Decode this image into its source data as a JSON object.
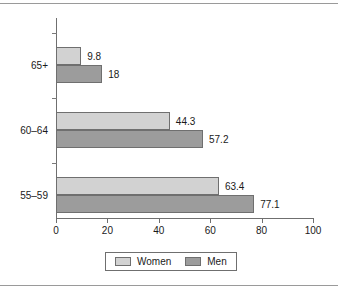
{
  "chart_data": {
    "type": "bar",
    "orientation": "horizontal",
    "title": "",
    "subtitle": "",
    "xlabel": "",
    "ylabel": "",
    "categories": [
      "65+",
      "60–64",
      "55–59"
    ],
    "series": [
      {
        "name": "Women",
        "color": "#d2d2d2",
        "values": [
          9.8,
          44.3,
          63.4
        ]
      },
      {
        "name": "Men",
        "color": "#9c9c9c",
        "values": [
          18,
          57.2,
          77.1
        ]
      }
    ],
    "value_labels": {
      "women": [
        "9.8",
        "44.3",
        "63.4"
      ],
      "men": [
        "18",
        "57.2",
        "77.1"
      ]
    },
    "xlim": [
      0,
      100
    ],
    "xticks": [
      0,
      20,
      40,
      60,
      80,
      100
    ],
    "xtick_labels": [
      "0",
      "20",
      "40",
      "60",
      "80",
      "100"
    ],
    "grid": false,
    "legend": {
      "position": "bottom",
      "entries": [
        {
          "label": "Women",
          "color": "#d2d2d2"
        },
        {
          "label": "Men",
          "color": "#9c9c9c"
        }
      ]
    }
  },
  "colors": {
    "women": "#d2d2d2",
    "men": "#9c9c9c",
    "axis": "#6f6f6f",
    "text": "#1a1a1a",
    "rule": "#9a9a9a",
    "background": "#ffffff"
  }
}
